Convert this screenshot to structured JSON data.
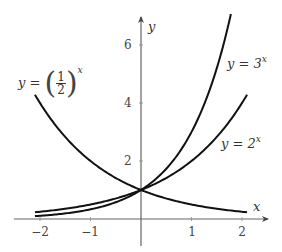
{
  "chart_data": {
    "type": "line",
    "title": "",
    "xlabel": "x",
    "ylabel": "y",
    "xlim": [
      -2.5,
      2.5
    ],
    "ylim": [
      0,
      7
    ],
    "grid": false,
    "x_ticks": [
      -2,
      -1,
      1,
      2
    ],
    "x_tick_labels": [
      "−2",
      "−1",
      "1",
      "2"
    ],
    "y_ticks": [
      2,
      4,
      6
    ],
    "y_tick_labels": [
      "2",
      "4",
      "6"
    ],
    "series": [
      {
        "name": "y = (1/2)^x",
        "function": "0.5^x",
        "x_range": [
          -2.1,
          2.1
        ],
        "points": [
          [
            -2,
            4
          ],
          [
            -1,
            2
          ],
          [
            0,
            1
          ],
          [
            1,
            0.5
          ],
          [
            2,
            0.25
          ]
        ]
      },
      {
        "name": "y = 2^x",
        "function": "2^x",
        "x_range": [
          -2.1,
          2.1
        ],
        "points": [
          [
            -2,
            0.25
          ],
          [
            -1,
            0.5
          ],
          [
            0,
            1
          ],
          [
            1,
            2
          ],
          [
            2,
            4
          ]
        ]
      },
      {
        "name": "y = 3^x",
        "function": "3^x",
        "x_range": [
          -2.1,
          1.78
        ],
        "points": [
          [
            -2,
            0.111
          ],
          [
            -1,
            0.333
          ],
          [
            0,
            1
          ],
          [
            1,
            3
          ],
          [
            1.77,
            7
          ]
        ]
      }
    ],
    "annotations": [
      {
        "text": "y = (1/2)^x",
        "near": [
          -2,
          5
        ]
      },
      {
        "text": "y = 3^x",
        "near": [
          1.9,
          5.3
        ]
      },
      {
        "text": "y = 2^x",
        "near": [
          1.8,
          2.5
        ]
      }
    ]
  },
  "labels": {
    "x_axis": "x",
    "y_axis": "y",
    "half": {
      "prefix": "y =",
      "num": "1",
      "den": "2",
      "exp": "x"
    },
    "three": {
      "prefix": "y = 3",
      "exp": "x"
    },
    "two": {
      "prefix": "y = 2",
      "exp": "x"
    },
    "xticks": [
      "−2",
      "−1",
      "1",
      "2"
    ],
    "yticks": [
      "2",
      "4",
      "6"
    ]
  },
  "style": {
    "axis_color": "#555555",
    "curve_color": "#111111"
  }
}
